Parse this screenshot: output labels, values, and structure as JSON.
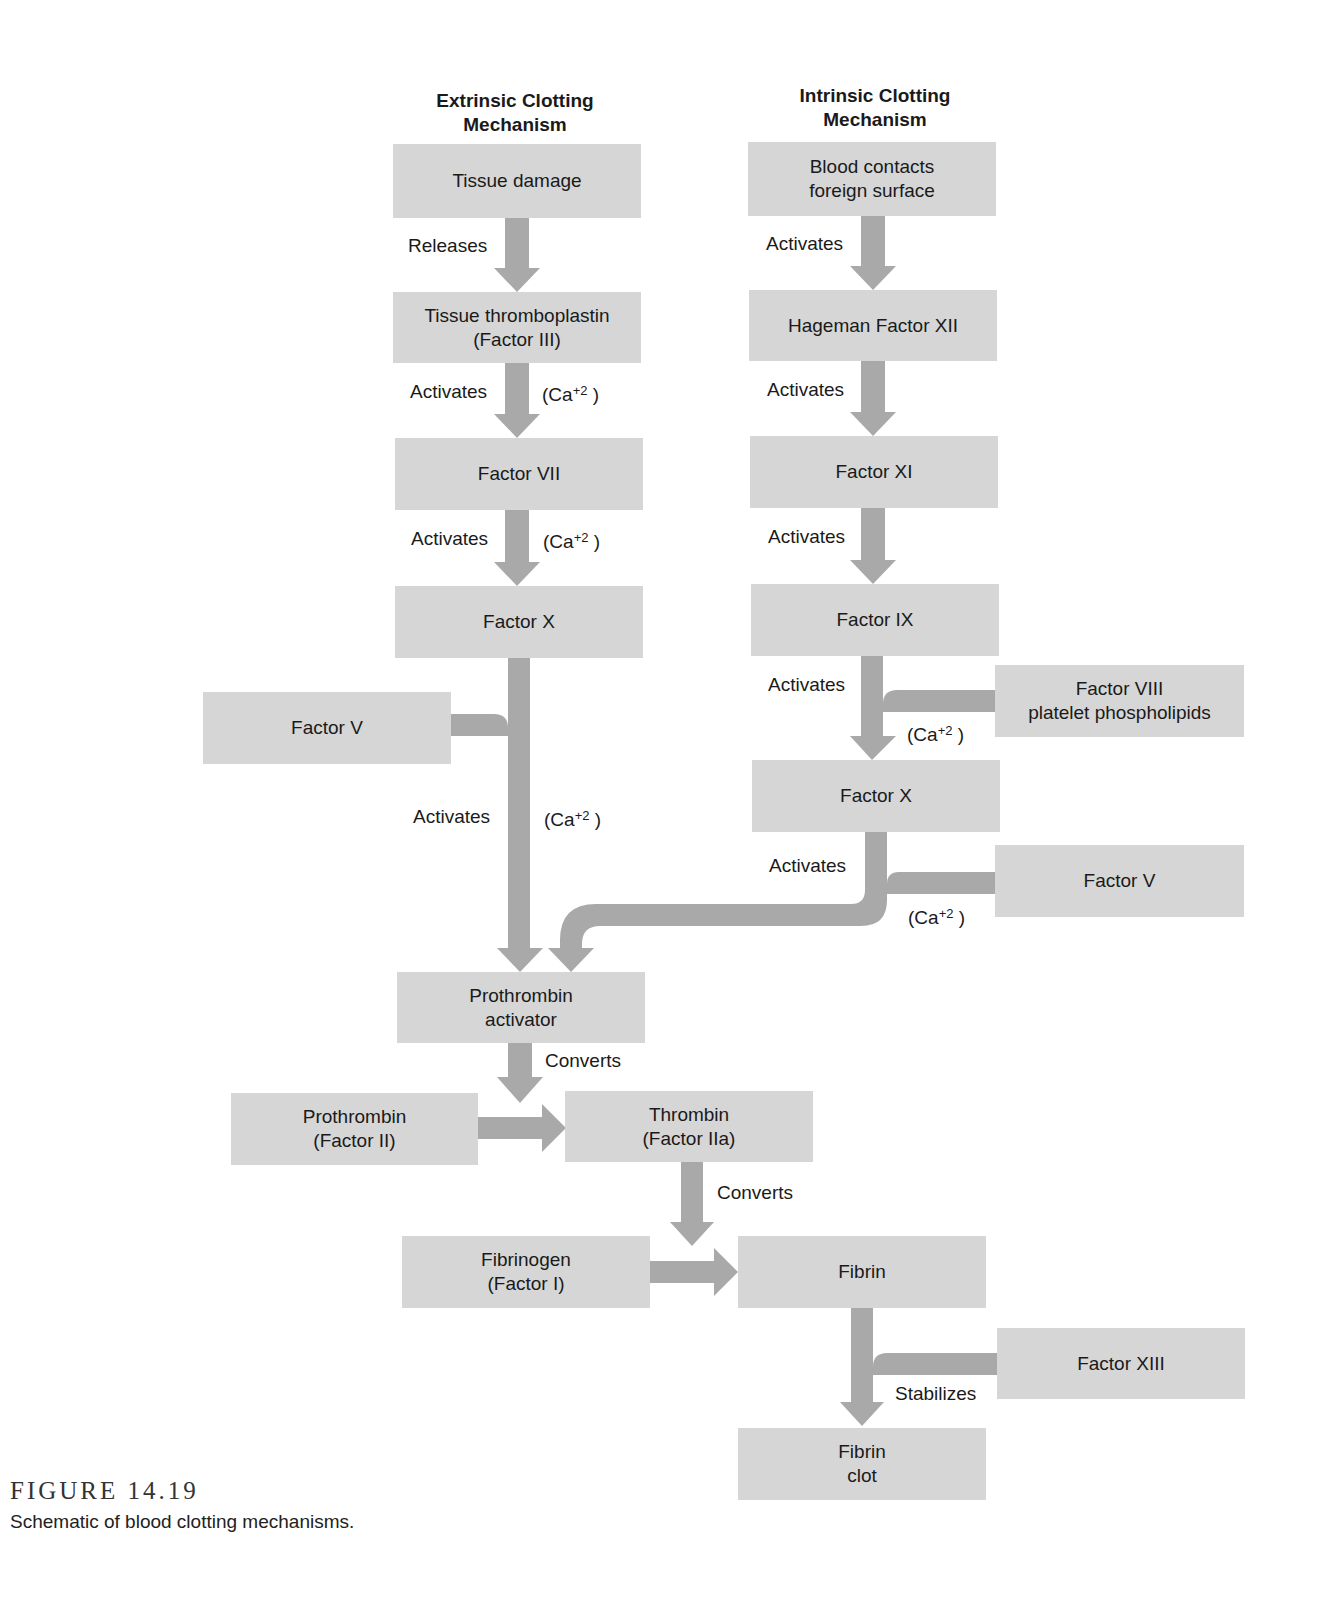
{
  "headers": {
    "extrinsic": [
      "Extrinsic Clotting",
      "Mechanism"
    ],
    "intrinsic": [
      "Intrinsic Clotting",
      "Mechanism"
    ]
  },
  "boxes": {
    "tissue_damage": [
      "Tissue damage"
    ],
    "tissue_thromboplastin": [
      "Tissue thromboplastin",
      "(Factor III)"
    ],
    "factor_vii": [
      "Factor VII"
    ],
    "factor_x_ext": [
      "Factor X"
    ],
    "factor_v_left": [
      "Factor V"
    ],
    "blood_contacts": [
      "Blood contacts",
      "foreign surface"
    ],
    "hageman": [
      "Hageman Factor XII"
    ],
    "factor_xi": [
      "Factor XI"
    ],
    "factor_ix": [
      "Factor IX"
    ],
    "factor_viii": [
      "Factor VIII",
      "platelet phospholipids"
    ],
    "factor_x_int": [
      "Factor X"
    ],
    "factor_v_right": [
      "Factor V"
    ],
    "prothrombin_activator": [
      "Prothrombin",
      "activator"
    ],
    "prothrombin": [
      "Prothrombin",
      "(Factor II)"
    ],
    "thrombin": [
      "Thrombin",
      "(Factor IIa)"
    ],
    "fibrinogen": [
      "Fibrinogen",
      "(Factor I)"
    ],
    "fibrin": [
      "Fibrin"
    ],
    "factor_xiii": [
      "Factor XIII"
    ],
    "fibrin_clot": [
      "Fibrin",
      "clot"
    ]
  },
  "labels": {
    "releases": "Releases",
    "activates": "Activates",
    "converts": "Converts",
    "stabilizes": "Stabilizes",
    "ca_prefix": "(Ca",
    "ca_sup": "+2",
    "ca_suffix": " )"
  },
  "figure": {
    "number": "FIGURE 14.19",
    "caption": "Schematic of blood clotting mechanisms."
  },
  "colors": {
    "box_fill": "#d6d6d6",
    "arrow_fill": "#a9a9a9"
  }
}
